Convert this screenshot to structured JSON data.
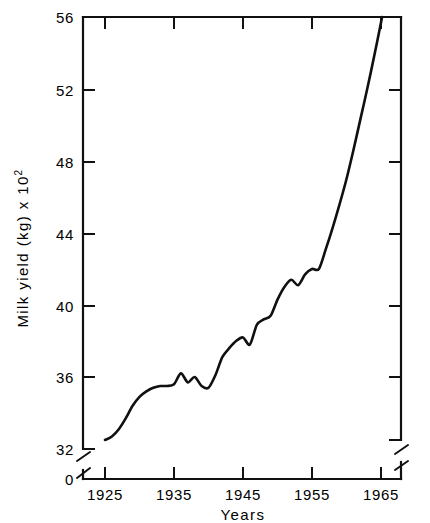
{
  "chart_data": {
    "type": "line",
    "title": "",
    "subtitle": "",
    "xlabel": "Years",
    "ylabel": "Milk yield (kg) x 10",
    "ylabel_exponent": "2",
    "ylabel_full": "Milk yield (kg) x 10^2",
    "xlim": [
      1922,
      1969
    ],
    "ylim": [
      32,
      56
    ],
    "y_axis_break": true,
    "y_break_from": 0,
    "y_break_to": 32,
    "grid": false,
    "legend": null,
    "legend_position": "none",
    "xticks": [
      1925,
      1935,
      1945,
      1955,
      1965
    ],
    "xtick_labels": [
      "1925",
      "1935",
      "1945",
      "1955",
      "1965"
    ],
    "yticks": [
      32,
      36,
      40,
      44,
      48,
      52,
      56
    ],
    "ytick_labels": [
      "32",
      "36",
      "40",
      "44",
      "48",
      "52",
      "56"
    ],
    "y_origin_label": "0",
    "series": [
      {
        "name": "Milk yield",
        "x": [
          1925,
          1926,
          1927,
          1928,
          1929,
          1930,
          1931,
          1932,
          1933,
          1934,
          1935,
          1936,
          1937,
          1938,
          1939,
          1940,
          1941,
          1942,
          1943,
          1944,
          1945,
          1946,
          1947,
          1948,
          1949,
          1950,
          1951,
          1952,
          1953,
          1954,
          1955,
          1956,
          1957,
          1958,
          1959,
          1960,
          1961,
          1962,
          1963,
          1964,
          1965,
          1966
        ],
        "y": [
          32.5,
          32.7,
          33.1,
          33.7,
          34.4,
          34.9,
          35.2,
          35.4,
          35.5,
          35.5,
          35.6,
          36.2,
          35.7,
          36.0,
          35.5,
          35.4,
          36.1,
          37.1,
          37.6,
          38.0,
          38.2,
          37.8,
          38.9,
          39.2,
          39.4,
          40.3,
          41.0,
          41.4,
          41.1,
          41.7,
          42.0,
          42.0,
          43.1,
          44.3,
          45.6,
          47.0,
          48.6,
          50.3,
          52.0,
          53.8,
          55.7,
          57.6
        ]
      }
    ]
  },
  "axes": {
    "x_title": "Years",
    "y_title_text": "Milk yield (kg) x 10",
    "y_title_exp": "2"
  }
}
